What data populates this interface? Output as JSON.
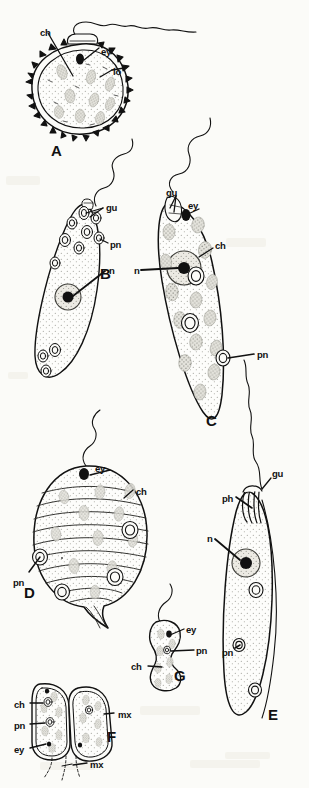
{
  "plate": {
    "background_color": "#fbfbf8",
    "ink_color": "#111111",
    "width": 309,
    "height": 788,
    "figure_labels": [
      {
        "id": "A",
        "text": "A",
        "x": 51,
        "y": 143
      },
      {
        "id": "B",
        "text": "B",
        "x": 100,
        "y": 266
      },
      {
        "id": "C",
        "text": "C",
        "x": 206,
        "y": 413
      },
      {
        "id": "D",
        "text": "D",
        "x": 24,
        "y": 585
      },
      {
        "id": "E",
        "text": "E",
        "x": 268,
        "y": 707
      },
      {
        "id": "F",
        "text": "F",
        "x": 107,
        "y": 729
      },
      {
        "id": "G",
        "text": "G",
        "x": 174,
        "y": 668
      }
    ],
    "part_labels": [
      {
        "figure": "A",
        "text": "ch",
        "x": 40,
        "y": 28
      },
      {
        "figure": "A",
        "text": "ey",
        "x": 101,
        "y": 47
      },
      {
        "figure": "A",
        "text": "lo",
        "x": 113,
        "y": 67
      },
      {
        "figure": "B",
        "text": "gu",
        "x": 106,
        "y": 203
      },
      {
        "figure": "B",
        "text": "pn",
        "x": 110,
        "y": 240
      },
      {
        "figure": "B",
        "text": "n",
        "x": 109,
        "y": 266
      },
      {
        "figure": "C",
        "text": "gu",
        "x": 166,
        "y": 188
      },
      {
        "figure": "C",
        "text": "ey",
        "x": 188,
        "y": 201
      },
      {
        "figure": "C",
        "text": "ch",
        "x": 215,
        "y": 241
      },
      {
        "figure": "C",
        "text": "n",
        "x": 134,
        "y": 266
      },
      {
        "figure": "C",
        "text": "pn",
        "x": 257,
        "y": 350
      },
      {
        "figure": "D",
        "text": "ey",
        "x": 95,
        "y": 464
      },
      {
        "figure": "D",
        "text": "ch",
        "x": 136,
        "y": 487
      },
      {
        "figure": "D",
        "text": "pn",
        "x": 13,
        "y": 578
      },
      {
        "figure": "E",
        "text": "gu",
        "x": 272,
        "y": 469
      },
      {
        "figure": "E",
        "text": "ph",
        "x": 222,
        "y": 494
      },
      {
        "figure": "E",
        "text": "n",
        "x": 207,
        "y": 534
      },
      {
        "figure": "E",
        "text": "pn",
        "x": 222,
        "y": 648
      },
      {
        "figure": "F",
        "text": "ch",
        "x": 14,
        "y": 700
      },
      {
        "figure": "F",
        "text": "mx",
        "x": 118,
        "y": 710
      },
      {
        "figure": "F",
        "text": "pn",
        "x": 14,
        "y": 721
      },
      {
        "figure": "F",
        "text": "ey",
        "x": 14,
        "y": 745
      },
      {
        "figure": "F",
        "text": "mx",
        "x": 90,
        "y": 760
      },
      {
        "figure": "G",
        "text": "ey",
        "x": 186,
        "y": 625
      },
      {
        "figure": "G",
        "text": "pn",
        "x": 196,
        "y": 646
      },
      {
        "figure": "G",
        "text": "ch",
        "x": 131,
        "y": 662
      }
    ],
    "abbreviations": {
      "ch": "chloroplast",
      "ey": "eyespot",
      "lo": "lorica",
      "gu": "gullet",
      "pn": "paramylon body",
      "n": "nucleus",
      "ph": "pharynx",
      "mx": "matrix"
    }
  }
}
